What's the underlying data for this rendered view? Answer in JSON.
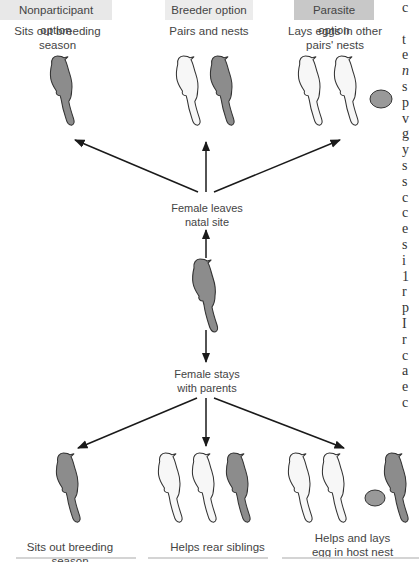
{
  "options": [
    {
      "label": "Nonparticipant option",
      "bg": "#e8e8e8",
      "caption": "Sits out breeding season"
    },
    {
      "label": "Breeder option",
      "bg": "#ececec",
      "caption": "Pairs and nests"
    },
    {
      "label": "Parasite option",
      "bg": "#c8c8c8",
      "caption_line1": "Lays eggs in other",
      "caption_line2": "pairs' nests"
    }
  ],
  "nodes": {
    "leaves": {
      "line1": "Female leaves",
      "line2": "natal site"
    },
    "stays": {
      "line1": "Female stays",
      "line2": "with parents"
    }
  },
  "bottom_options": [
    {
      "caption": "Sits out breeding season"
    },
    {
      "caption": "Helps rear siblings"
    },
    {
      "caption_line1": "Helps and lays",
      "caption_line2": "egg in host nest"
    }
  ],
  "side_text_fragments": [
    "c",
    "",
    "t",
    "e",
    "n",
    "s",
    "p",
    "v",
    "g",
    "y",
    "s",
    "s",
    "c",
    "c",
    "e",
    "s",
    "i",
    "1",
    "r",
    "p",
    "I",
    "r",
    "c",
    "a",
    "e",
    "c"
  ],
  "colors": {
    "dark_bird": "#8c8c8c",
    "light_bird": "#f7f7f7",
    "outline": "#333333",
    "egg": "#999999",
    "arrow": "#1a1a1a"
  }
}
